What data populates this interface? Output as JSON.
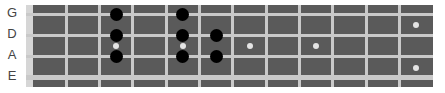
{
  "diagram": {
    "type": "bass-fretboard",
    "strings": [
      {
        "name": "G",
        "y": 9,
        "thickness": 3,
        "label_y": 8
      },
      {
        "name": "D",
        "y": 30,
        "thickness": 3,
        "label_y": 29
      },
      {
        "name": "A",
        "y": 51,
        "thickness": 3,
        "label_y": 50
      },
      {
        "name": "E",
        "y": 72,
        "thickness": 5,
        "label_y": 71
      }
    ],
    "fret_count": 12,
    "fret_width": 33.33,
    "inlays": [
      {
        "fret": 3,
        "y": 41
      },
      {
        "fret": 5,
        "y": 41
      },
      {
        "fret": 7,
        "y": 41
      },
      {
        "fret": 9,
        "y": 41
      },
      {
        "fret": 12,
        "y": 20
      },
      {
        "fret": 12,
        "y": 63
      }
    ],
    "notes": [
      {
        "string": "G",
        "fret": 3
      },
      {
        "string": "G",
        "fret": 5
      },
      {
        "string": "D",
        "fret": 3
      },
      {
        "string": "D",
        "fret": 5
      },
      {
        "string": "D",
        "fret": 6
      },
      {
        "string": "A",
        "fret": 3
      },
      {
        "string": "A",
        "fret": 5
      },
      {
        "string": "A",
        "fret": 6
      }
    ],
    "colors": {
      "board": "#5a5a5a",
      "string": "#c9c9c9",
      "nut": "#d6d6d6",
      "inlay": "#e4e4e4",
      "note": "#000000",
      "label": "#444444"
    }
  }
}
